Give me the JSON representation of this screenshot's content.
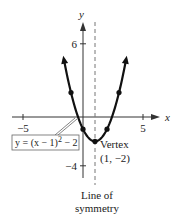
{
  "chart_data": {
    "type": "line",
    "title": "",
    "xlabel": "x",
    "ylabel": "y",
    "xlim": [
      -6.5,
      7.5
    ],
    "ylim": [
      -5.5,
      7.5
    ],
    "x_ticks": [
      {
        "value": -5,
        "label": "−5"
      },
      {
        "value": 5,
        "label": "5"
      }
    ],
    "y_ticks": [
      {
        "value": 6,
        "label": "6"
      },
      {
        "value": -4,
        "label": "−4"
      }
    ],
    "grid": false,
    "function": {
      "expression": "(x-1)^2 - 2",
      "x_range": [
        -1.6,
        3.6
      ]
    },
    "points": [
      {
        "x": -1,
        "y": 2
      },
      {
        "x": 0,
        "y": -1
      },
      {
        "x": 1,
        "y": -2
      },
      {
        "x": 2,
        "y": -1
      },
      {
        "x": 3,
        "y": 2
      }
    ],
    "axis_of_symmetry": {
      "x": 1,
      "label_line1": "Line of",
      "label_line2": "symmetry"
    },
    "vertex": {
      "x": 1,
      "y": -2,
      "label_line1": "Vertex",
      "label_line2": "(1, −2)"
    },
    "equation_label": {
      "prefix": "y = (x − 1)",
      "exponent": "2",
      "suffix": " − 2"
    }
  }
}
